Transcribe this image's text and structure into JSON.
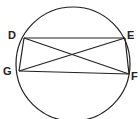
{
  "diagram": {
    "type": "circle-inscribed-quadrilateral",
    "circle": {
      "cx": 73,
      "cy": 64,
      "r": 57
    },
    "points": [
      {
        "label": "D",
        "x": 24,
        "y": 38,
        "lx": 8,
        "ly": 39
      },
      {
        "label": "E",
        "x": 125,
        "y": 38,
        "lx": 127,
        "ly": 39
      },
      {
        "label": "F",
        "x": 129,
        "y": 74,
        "lx": 131,
        "ly": 80
      },
      {
        "label": "G",
        "x": 19,
        "y": 71,
        "lx": 3,
        "ly": 75
      }
    ],
    "segments": [
      [
        "D",
        "E"
      ],
      [
        "E",
        "F"
      ],
      [
        "F",
        "G"
      ],
      [
        "G",
        "D"
      ],
      [
        "D",
        "F"
      ],
      [
        "E",
        "G"
      ]
    ],
    "stroke_color": "#222222"
  }
}
